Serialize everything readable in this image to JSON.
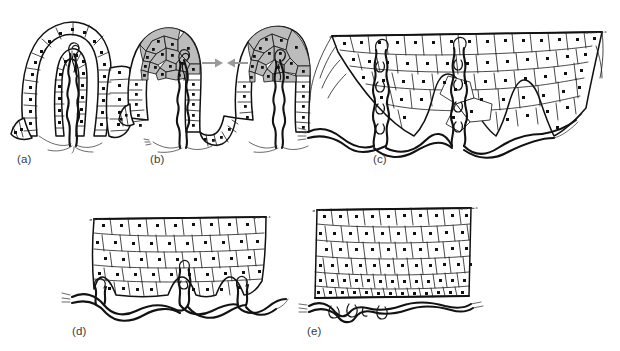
{
  "figure": {
    "type": "scientific-line-diagram",
    "background_color": "#ffffff",
    "ink_color": "#111111",
    "shaded_cell_color": "#bcbcbc",
    "arrow_color": "#9a9a9a",
    "label_color": "#3a3a3a",
    "width": 620,
    "height": 351
  },
  "panels": [
    {
      "id": "a",
      "label": "(a)",
      "label_x": 17,
      "label_y": 153,
      "description": "Single deep epithelial invagination (placode) lined by a simple columnar cell layer with basal nuclei; a bundle of nerve fibres ascends within the core and branches at the base.",
      "has_shaded_cells": false,
      "has_arrows": false,
      "cell_layers": 1,
      "nerve_bundles": 1
    },
    {
      "id": "b",
      "label": "(b)",
      "label_x": 150,
      "label_y": 153,
      "description": "Two adjacent invaginations converging; apical cells of both folds are shaded grey and a pair of opposing grey arrows indicates the two epithelial domains approaching one another.",
      "has_shaded_cells": true,
      "has_arrows": true,
      "arrow_count": 2,
      "arrow_direction": "converging",
      "cell_layers": 2,
      "nerve_bundles": 2
    },
    {
      "id": "c",
      "label": "(c)",
      "label_x": 373,
      "label_y": 153,
      "description": "Fused epithelium forming a thick stratified sheet with two deep rete pegs; flattened cells at the surface grade into polygonal cells at depth, with nerve fibres running up each peg and a plexus beneath.",
      "has_shaded_cells": false,
      "has_arrows": false,
      "cell_layers": 3,
      "nerve_bundles": 2
    },
    {
      "id": "d",
      "label": "(d)",
      "label_x": 72,
      "label_y": 333,
      "description": "Shallower epithelium with short rete ridges; flattened superficial squames above a basal layer of cuboidal cells, with an undulating subepithelial nerve plexus sending branches into the ridges.",
      "has_shaded_cells": false,
      "has_arrows": false,
      "cell_layers": 3,
      "nerve_bundles": 3
    },
    {
      "id": "e",
      "label": "(e)",
      "label_x": 307,
      "label_y": 333,
      "description": "Mature flat stratified epithelium with a smooth basement membrane; columnar basal cells, polygonal spinous cells and flattened surface cells, underlain by a wavy horizontal nerve plexus.",
      "has_shaded_cells": false,
      "has_arrows": false,
      "cell_layers": 3,
      "nerve_bundles": 1
    }
  ]
}
